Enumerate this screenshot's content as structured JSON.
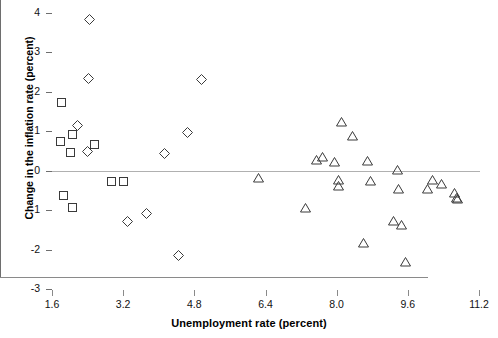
{
  "chart_data": {
    "type": "scatter",
    "title": "",
    "xlabel": "Unemployment rate (percent)",
    "ylabel": "Change in the inflation rate (percent)",
    "xlim": [
      1.6,
      11.2
    ],
    "ylim": [
      -3,
      4
    ],
    "xticks": [
      "1.6",
      "3.2",
      "4.8",
      "6.4",
      "8.0",
      "9.6",
      "11.2"
    ],
    "xtick_values": [
      1.6,
      3.2,
      4.8,
      6.4,
      8.0,
      9.6,
      11.2
    ],
    "yticks": [
      "4",
      "3",
      "2",
      "1",
      "0",
      "-1",
      "-2",
      "-3"
    ],
    "ytick_values": [
      4,
      3,
      2,
      1,
      0,
      -1,
      -2,
      -3
    ],
    "grid": false,
    "zero_reference_line": 0,
    "legend": [],
    "marker_color": "#3a3a3a",
    "zero_line_color": "#b0b0b0",
    "axis_color": "#8a8a8a",
    "series": [
      {
        "name": "square-series",
        "marker": "square",
        "points": [
          {
            "x": 1.82,
            "y": 1.72
          },
          {
            "x": 1.8,
            "y": 0.73
          },
          {
            "x": 2.05,
            "y": 0.93
          },
          {
            "x": 2.02,
            "y": 0.45
          },
          {
            "x": 2.55,
            "y": 0.67
          },
          {
            "x": 2.93,
            "y": -0.28
          },
          {
            "x": 3.2,
            "y": -0.28
          },
          {
            "x": 1.86,
            "y": -0.62
          },
          {
            "x": 2.06,
            "y": -0.93
          }
        ]
      },
      {
        "name": "diamond-series",
        "marker": "diamond",
        "points": [
          {
            "x": 2.45,
            "y": 3.83
          },
          {
            "x": 2.43,
            "y": 2.33
          },
          {
            "x": 4.95,
            "y": 2.31
          },
          {
            "x": 2.18,
            "y": 1.14
          },
          {
            "x": 4.65,
            "y": 0.97
          },
          {
            "x": 2.4,
            "y": 0.48
          },
          {
            "x": 4.13,
            "y": 0.43
          },
          {
            "x": 3.3,
            "y": -1.28
          },
          {
            "x": 3.72,
            "y": -1.08
          },
          {
            "x": 4.45,
            "y": -2.14
          }
        ]
      },
      {
        "name": "triangle-series",
        "marker": "triangle",
        "points": [
          {
            "x": 8.1,
            "y": 1.25
          },
          {
            "x": 8.35,
            "y": 0.88
          },
          {
            "x": 7.55,
            "y": 0.28
          },
          {
            "x": 7.68,
            "y": 0.36
          },
          {
            "x": 7.95,
            "y": 0.22
          },
          {
            "x": 8.7,
            "y": 0.25
          },
          {
            "x": 6.25,
            "y": -0.19
          },
          {
            "x": 8.05,
            "y": -0.22
          },
          {
            "x": 8.05,
            "y": -0.38
          },
          {
            "x": 8.75,
            "y": -0.26
          },
          {
            "x": 9.37,
            "y": 0.03
          },
          {
            "x": 9.4,
            "y": -0.46
          },
          {
            "x": 10.05,
            "y": -0.45
          },
          {
            "x": 10.35,
            "y": -0.33
          },
          {
            "x": 10.15,
            "y": -0.22
          },
          {
            "x": 10.65,
            "y": -0.56
          },
          {
            "x": 10.72,
            "y": -0.72
          },
          {
            "x": 10.7,
            "y": -0.69
          },
          {
            "x": 7.3,
            "y": -0.93
          },
          {
            "x": 9.27,
            "y": -1.28
          },
          {
            "x": 9.45,
            "y": -1.38
          },
          {
            "x": 8.6,
            "y": -1.82
          },
          {
            "x": 9.55,
            "y": -2.32
          }
        ]
      }
    ]
  }
}
